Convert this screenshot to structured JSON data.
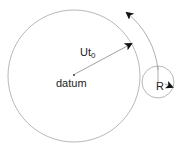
{
  "diagram": {
    "labels": {
      "radius_main": "Ut",
      "radius_sub": "0",
      "center": "datum",
      "small_radius": "R"
    },
    "colors": {
      "circle_stroke": "#b8b8b8",
      "arrow_stroke": "#888888",
      "arrowhead": "#111111",
      "text": "#222222"
    }
  }
}
